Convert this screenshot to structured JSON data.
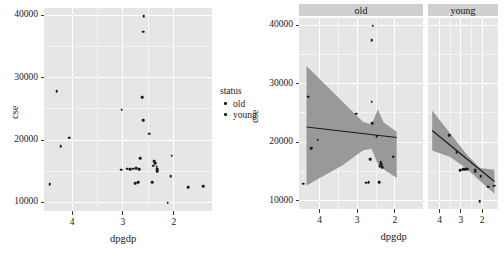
{
  "chart_data": [
    {
      "id": "left-panel",
      "type": "scatter",
      "title": "",
      "xlabel": "dpgdp",
      "ylabel": "cse",
      "xlim": [
        4.55,
        1.25
      ],
      "ylim": [
        8600,
        41200
      ],
      "x_reversed": true,
      "xticks": [
        4,
        3,
        2
      ],
      "xticklabels": [
        "4",
        "3",
        "2"
      ],
      "yticks": [
        10000,
        20000,
        30000,
        40000
      ],
      "yticklabels": [
        "10000",
        "20000",
        "30000",
        "40000"
      ],
      "grid": true,
      "legend": {
        "title": "status",
        "position": "right",
        "entries": [
          {
            "label": "old",
            "color": "#1a1a1a",
            "marker": "point"
          },
          {
            "label": "young",
            "color": "#1a1a1a",
            "marker": "point"
          }
        ]
      },
      "series": [
        {
          "name": "all",
          "points": [
            [
              4.3,
              27800
            ],
            [
              4.22,
              19000
            ],
            [
              4.05,
              20400
            ],
            [
              4.44,
              12900
            ],
            [
              3.02,
              24900
            ],
            [
              3.03,
              15200
            ],
            [
              2.92,
              15400
            ],
            [
              2.86,
              15350
            ],
            [
              2.8,
              15400
            ],
            [
              2.74,
              15450
            ],
            [
              2.76,
              13100
            ],
            [
              2.7,
              13200
            ],
            [
              2.66,
              17100
            ],
            [
              2.68,
              15350
            ],
            [
              2.62,
              26900
            ],
            [
              2.6,
              23200
            ],
            [
              2.6,
              37400
            ],
            [
              2.59,
              39900
            ],
            [
              2.48,
              21000
            ],
            [
              2.38,
              16600
            ],
            [
              2.36,
              16250
            ],
            [
              2.34,
              15700
            ],
            [
              2.33,
              15300
            ],
            [
              2.33,
              14950
            ],
            [
              2.4,
              15900
            ],
            [
              2.42,
              13200
            ],
            [
              2.04,
              17500
            ],
            [
              2.06,
              14200
            ],
            [
              2.12,
              9900
            ],
            [
              1.72,
              12400
            ],
            [
              1.42,
              12600
            ]
          ]
        }
      ]
    },
    {
      "id": "right-facets",
      "type": "scatter",
      "title": "",
      "xlabel": "dpgdp",
      "ylabel": "cse",
      "xlim": [
        4.55,
        1.25
      ],
      "ylim": [
        8600,
        41200
      ],
      "x_reversed": true,
      "xticks": [
        4,
        3,
        2
      ],
      "xticklabels": [
        "4",
        "3",
        "2"
      ],
      "yticks": [
        10000,
        20000,
        30000,
        40000
      ],
      "yticklabels": [
        "10000",
        "20000",
        "30000",
        "40000"
      ],
      "grid": true,
      "facet_var": "status",
      "facets": [
        {
          "label": "old",
          "points": [
            [
              2.62,
              37400
            ],
            [
              2.59,
              39900
            ],
            [
              2.62,
              26900
            ],
            [
              2.6,
              23200
            ],
            [
              3.02,
              24900
            ],
            [
              4.3,
              27800
            ],
            [
              4.05,
              20400
            ],
            [
              4.22,
              19000
            ],
            [
              2.48,
              21000
            ],
            [
              2.66,
              17100
            ],
            [
              2.4,
              15900
            ],
            [
              2.38,
              16600
            ],
            [
              2.36,
              16250
            ],
            [
              2.34,
              15700
            ],
            [
              2.76,
              13100
            ],
            [
              2.7,
              13200
            ],
            [
              2.42,
              13200
            ],
            [
              2.04,
              17500
            ],
            [
              4.44,
              12900
            ]
          ],
          "fit": {
            "type": "linear",
            "line": [
              [
                4.35,
                22600
              ],
              [
                1.95,
                20800
              ]
            ],
            "band_upper": [
              [
                4.35,
                33000
              ],
              [
                3.4,
                27000
              ],
              [
                2.85,
                23500
              ],
              [
                2.62,
                23000
              ],
              [
                2.45,
                25600
              ],
              [
                2.3,
                23400
              ],
              [
                1.95,
                21800
              ]
            ],
            "band_lower": [
              [
                4.35,
                12600
              ],
              [
                3.4,
                16000
              ],
              [
                2.85,
                18600
              ],
              [
                2.62,
                18900
              ],
              [
                2.45,
                16200
              ],
              [
                2.3,
                15400
              ],
              [
                1.95,
                13900
              ]
            ],
            "band_color": "#999999",
            "line_color": "#1a1a1a"
          }
        },
        {
          "label": "young",
          "points": [
            [
              3.03,
              15200
            ],
            [
              2.92,
              15400
            ],
            [
              2.86,
              15350
            ],
            [
              2.8,
              15400
            ],
            [
              2.74,
              15450
            ],
            [
              2.68,
              15350
            ],
            [
              2.33,
              15300
            ],
            [
              2.33,
              14950
            ],
            [
              2.06,
              14200
            ],
            [
              1.72,
              12400
            ],
            [
              1.42,
              12600
            ],
            [
              2.12,
              9900
            ],
            [
              3.55,
              21200
            ],
            [
              3.2,
              18300
            ]
          ],
          "fit": {
            "type": "linear",
            "line": [
              [
                4.35,
                22000
              ],
              [
                1.42,
                13300
              ]
            ],
            "band_upper": [
              [
                4.35,
                25400
              ],
              [
                3.5,
                21500
              ],
              [
                2.7,
                17800
              ],
              [
                2.1,
                15600
              ],
              [
                1.42,
                15300
              ]
            ],
            "band_lower": [
              [
                4.35,
                18600
              ],
              [
                3.5,
                17500
              ],
              [
                2.7,
                15400
              ],
              [
                2.1,
                13400
              ],
              [
                1.42,
                11200
              ]
            ],
            "band_color": "#999999",
            "line_color": "#1a1a1a"
          }
        }
      ]
    }
  ],
  "left": {
    "ylabel": "cse",
    "xlabel": "dpgdp",
    "yticklabels": [
      "40000",
      "30000",
      "20000",
      "10000"
    ],
    "xticklabels": [
      "4",
      "3",
      "2"
    ],
    "legend": {
      "title": "status",
      "items": [
        {
          "label": "old"
        },
        {
          "label": "young"
        }
      ]
    }
  },
  "right": {
    "ylabel": "cse",
    "xlabel": "dpgdp",
    "yticklabels": [
      "40000",
      "30000",
      "20000",
      "10000"
    ],
    "strips": [
      {
        "label": "old"
      },
      {
        "label": "young"
      }
    ],
    "facet_xticklabels_old": [
      "4",
      "3",
      "2"
    ],
    "facet_xticklabels_young": [
      "4",
      "3",
      "2"
    ]
  },
  "colors": {
    "panel_bg": "#e6e6e6",
    "gridline": "#ffffff",
    "strip_bg": "#cfcfcf",
    "point": "#1a1a1a",
    "band": "#999999",
    "fitline": "#1a1a1a"
  }
}
